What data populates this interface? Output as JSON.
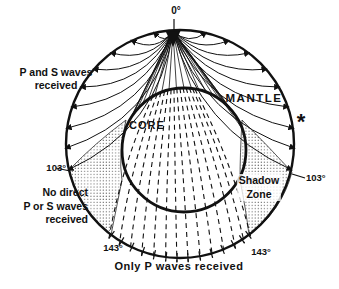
{
  "figure": {
    "type": "earth-seismic-shadow-zone-diagram",
    "colors": {
      "ink": "#111111",
      "background": "#ffffff",
      "stipple": "#555555"
    },
    "labels": {
      "source_angle": "0°",
      "upper_left_line1": "P and S waves",
      "upper_left_line2": "received",
      "mantle": "MANTLE",
      "core": "CORE",
      "station_asterisk": "*",
      "angle_103_left": "103°",
      "angle_103_right": "103°",
      "angle_143_left": "143°",
      "angle_143_right": "143°",
      "shadow_line1": "Shadow",
      "shadow_line2": "Zone",
      "no_direct_line1": "No direct",
      "no_direct_line2": "P or S waves",
      "no_direct_line3": "received",
      "bottom_caption": "Only P waves received"
    }
  }
}
